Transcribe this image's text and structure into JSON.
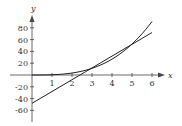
{
  "chart_data": {
    "type": "line",
    "title": "",
    "xlabel": "x",
    "ylabel": "y",
    "xlim": [
      0,
      6.5
    ],
    "ylim": [
      -70,
      95
    ],
    "x_ticks": [
      1,
      2,
      3,
      4,
      5,
      6
    ],
    "y_ticks": [
      -60,
      -40,
      -20,
      20,
      40,
      60,
      80
    ],
    "grid": false,
    "legend": null,
    "series": [
      {
        "name": "curve",
        "description": "cubic curve tangent to the line near x=4",
        "x": [
          0,
          1,
          2,
          3,
          4,
          5,
          6
        ],
        "y": [
          0,
          0.4,
          3.4,
          11.3,
          26.9,
          52.5,
          90.7
        ]
      },
      {
        "name": "tangent line",
        "description": "straight line y = 20x - 48",
        "x": [
          0,
          6
        ],
        "y": [
          -48,
          72
        ]
      }
    ],
    "colors": {
      "curves": "#222222",
      "axes": "#444444"
    }
  }
}
